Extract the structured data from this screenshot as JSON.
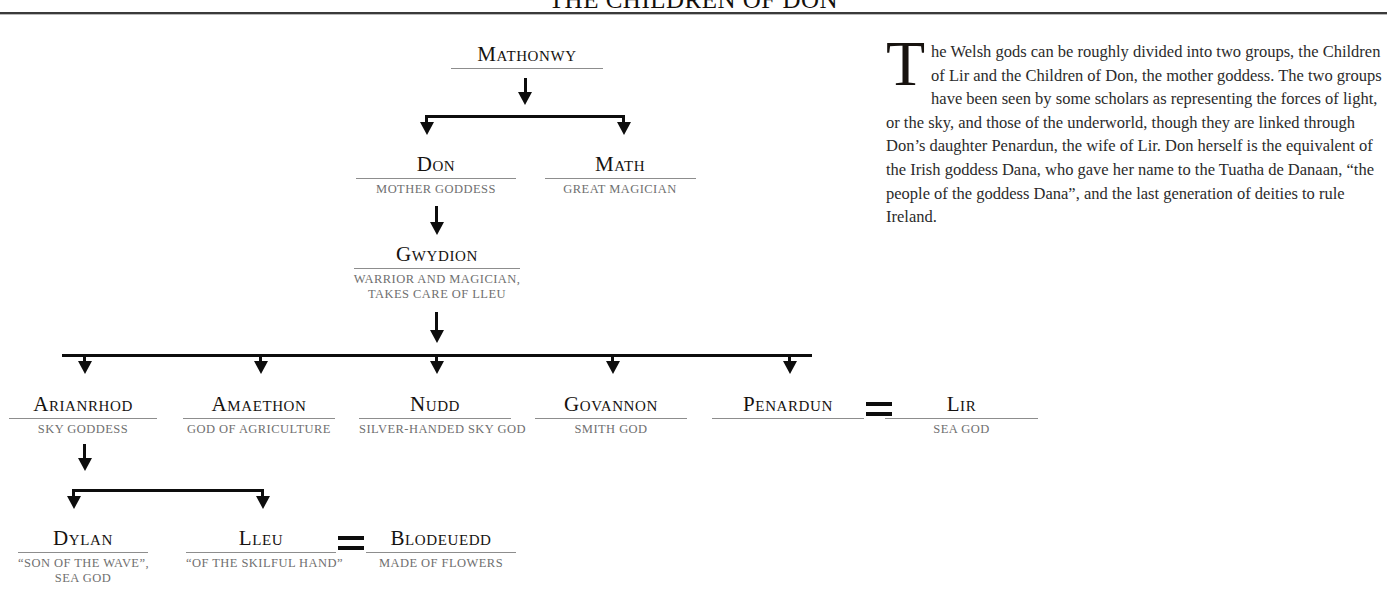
{
  "title": "THE CHILDREN OF DON",
  "marriage_symbol": "=",
  "colors": {
    "ink": "#0d0d0d",
    "name": "#15120f",
    "description": "#6f6f6f",
    "rule": "#8d8d8d",
    "body_text": "#2b2b2b",
    "background": "#ffffff"
  },
  "nodes": {
    "mathonwy": {
      "name": "Mathonwy",
      "desc": ""
    },
    "don": {
      "name": "Don",
      "desc": "MOTHER GODDESS"
    },
    "math": {
      "name": "Math",
      "desc": "GREAT MAGICIAN"
    },
    "gwydion": {
      "name": "Gwydion",
      "desc_line1": "WARRIOR AND MAGICIAN,",
      "desc_line2": "TAKES CARE OF LLEU"
    },
    "arianrhod": {
      "name": "Arianrhod",
      "desc": "SKY GODDESS"
    },
    "amaethon": {
      "name": "Amaethon",
      "desc": "GOD OF AGRICULTURE"
    },
    "nudd": {
      "name": "Nudd",
      "desc": "SILVER-HANDED SKY GOD"
    },
    "govannon": {
      "name": "Govannon",
      "desc": "SMITH GOD"
    },
    "penardun": {
      "name": "Penardun",
      "desc": ""
    },
    "lir": {
      "name": "Lir",
      "desc": "SEA GOD"
    },
    "dylan": {
      "name": "Dylan",
      "desc_line1": "“SON OF THE WAVE”,",
      "desc_line2": "SEA GOD"
    },
    "lleu": {
      "name": "Lleu",
      "desc": "“OF THE SKILFUL HAND”"
    },
    "blodeuedd": {
      "name": "Blodeuedd",
      "desc": "MADE OF FLOWERS"
    }
  },
  "article": {
    "dropcap": "T",
    "text": "he Welsh gods can be roughly divided into two groups, the Children of Lir and the Children of Don, the mother goddess. The two groups have been seen by some scholars as representing the forces of light, or the sky, and those of the underworld, though they are linked through Don’s daughter Penardun, the wife of Lir. Don herself is the equivalent of the Irish goddess Dana, who gave her name to the Tuatha de Danaan, “the people of the goddess Dana”, and the last generation of deities to rule Ireland."
  }
}
